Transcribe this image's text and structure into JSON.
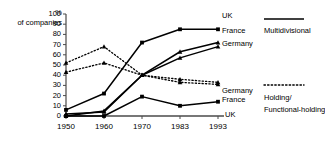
{
  "chart_data": {
    "type": "line",
    "title": "",
    "xlabel": "",
    "ylabel": "% of companies",
    "ylabel_line1": "%",
    "ylabel_line2": "of companies",
    "categories": [
      "1950",
      "1960",
      "1970",
      "1983",
      "1993"
    ],
    "x": [
      1950,
      1960,
      1970,
      1983,
      1993
    ],
    "ylim": [
      0,
      100
    ],
    "yticks": [
      "0",
      "10",
      "20",
      "30",
      "40",
      "50",
      "60",
      "70",
      "80",
      "90",
      "100"
    ],
    "ytick_values": [
      0,
      10,
      20,
      30,
      40,
      50,
      60,
      70,
      80,
      90,
      100
    ],
    "grid": false,
    "legend_position": "right",
    "series": [
      {
        "name": "UK",
        "group": "Multidivisional",
        "style": "solid",
        "marker": "square",
        "values": [
          6,
          22,
          72,
          85,
          85
        ]
      },
      {
        "name": "France",
        "group": "Multidivisional",
        "style": "solid",
        "marker": "triangle",
        "values": [
          0,
          5,
          40,
          63,
          72
        ]
      },
      {
        "name": "Germany",
        "group": "Multidivisional",
        "style": "solid",
        "marker": "triangle",
        "values": [
          2,
          4,
          40,
          57,
          68
        ]
      },
      {
        "name": "Germany",
        "group": "Holding/Functional-holding",
        "style": "dotted",
        "marker": "triangle",
        "values": [
          52,
          68,
          40,
          33,
          31
        ]
      },
      {
        "name": "France",
        "group": "Holding/Functional-holding",
        "style": "dotted",
        "marker": "triangle",
        "values": [
          43,
          52,
          40,
          36,
          33
        ]
      },
      {
        "name": "UK",
        "group": "Holding/Functional-holding",
        "style": "solid",
        "marker": "square",
        "values": [
          0,
          0,
          19,
          10,
          14
        ]
      }
    ]
  },
  "legend": {
    "top": {
      "labels": [
        "UK",
        "France",
        "Germany"
      ],
      "title": "Multidivisional",
      "line_style": "solid"
    },
    "bottom": {
      "labels": [
        "Germany",
        "France",
        "UK"
      ],
      "title_line1": "Holding/",
      "title_line2": "Functional-holding",
      "title": "Holding/Functional-holding",
      "line_style": "dotted"
    }
  },
  "colors": {
    "line": "#000000",
    "axis": "#4a4a4a",
    "background": "#ffffff"
  }
}
